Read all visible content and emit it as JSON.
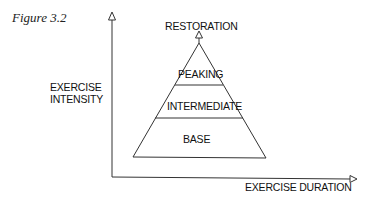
{
  "figure": {
    "caption": "Figure 3.2",
    "axes": {
      "y_label_line1": "EXERCISE",
      "y_label_line2": "INTENSITY",
      "x_label": "EXERCISE DURATION"
    },
    "pyramid": {
      "top_label": "RESTORATION",
      "levels": [
        {
          "label": "PEAKING"
        },
        {
          "label": "INTERMEDIATE"
        },
        {
          "label": "BASE"
        }
      ]
    },
    "colors": {
      "line": "#333333",
      "background": "#ffffff"
    }
  }
}
